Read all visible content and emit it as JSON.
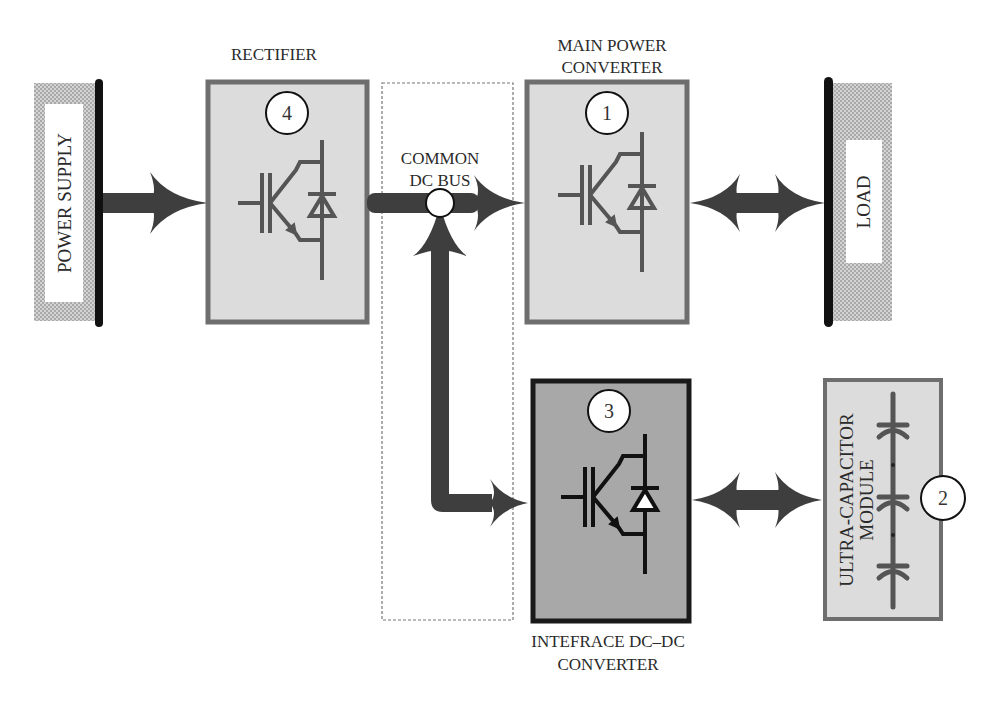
{
  "diagram": {
    "blocks": {
      "power_supply": {
        "label": "POWER SUPPLY"
      },
      "rectifier": {
        "title": "RECTIFIER",
        "number": "4"
      },
      "common_dc_bus": {
        "title_line1": "COMMON",
        "title_line2": "DC BUS"
      },
      "main_converter": {
        "title_line1": "MAIN POWER",
        "title_line2": "CONVERTER",
        "number": "1"
      },
      "load": {
        "label": "LOAD"
      },
      "interface_converter": {
        "title_line1": "INTEFRACE DC–DC",
        "title_line2": "CONVERTER",
        "number": "3"
      },
      "ultracap": {
        "label_line1": "ULTRA-CAPACITOR",
        "label_line2": "MODULE",
        "number": "2"
      }
    },
    "connections": [
      {
        "from": "power_supply",
        "to": "rectifier",
        "type": "unidirectional"
      },
      {
        "from": "rectifier",
        "to": "common_dc_bus",
        "type": "unidirectional"
      },
      {
        "from": "common_dc_bus",
        "to": "main_converter",
        "type": "unidirectional"
      },
      {
        "from": "main_converter",
        "to": "load",
        "type": "bidirectional"
      },
      {
        "from": "common_dc_bus",
        "to": "interface_converter",
        "type": "bidirectional"
      },
      {
        "from": "interface_converter",
        "to": "ultracap",
        "type": "bidirectional"
      }
    ],
    "colors": {
      "block_fill": "#dcdcdc",
      "block_border": "#6e6e6e",
      "interface_fill": "#a8a8a8",
      "interface_border": "#1a1a1a",
      "arrow": "#3e3e3e",
      "bus_bar": "#111111",
      "hatch": "#bdbdbd"
    }
  }
}
